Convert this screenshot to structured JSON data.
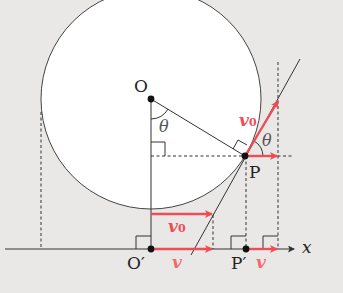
{
  "diagram": {
    "type": "rolling-circle-velocity",
    "colors": {
      "background": "#e9e8e6",
      "circle_fill": "#ffffff",
      "line": "#333333",
      "vector": "#ee4d55"
    },
    "points": {
      "O": "O",
      "O_prime": "O′",
      "P": "P",
      "P_prime": "P′"
    },
    "angles": {
      "theta_at_O": "θ",
      "theta_at_P": "θ"
    },
    "vectors": {
      "v0_at_P": {
        "symbol": "v",
        "subscript": "0"
      },
      "v0_at_bottom": {
        "symbol": "v",
        "subscript": "0"
      },
      "v_at_O_prime": {
        "symbol": "v"
      },
      "v_at_P_prime": {
        "symbol": "v"
      }
    },
    "axis": {
      "label": "x"
    }
  }
}
